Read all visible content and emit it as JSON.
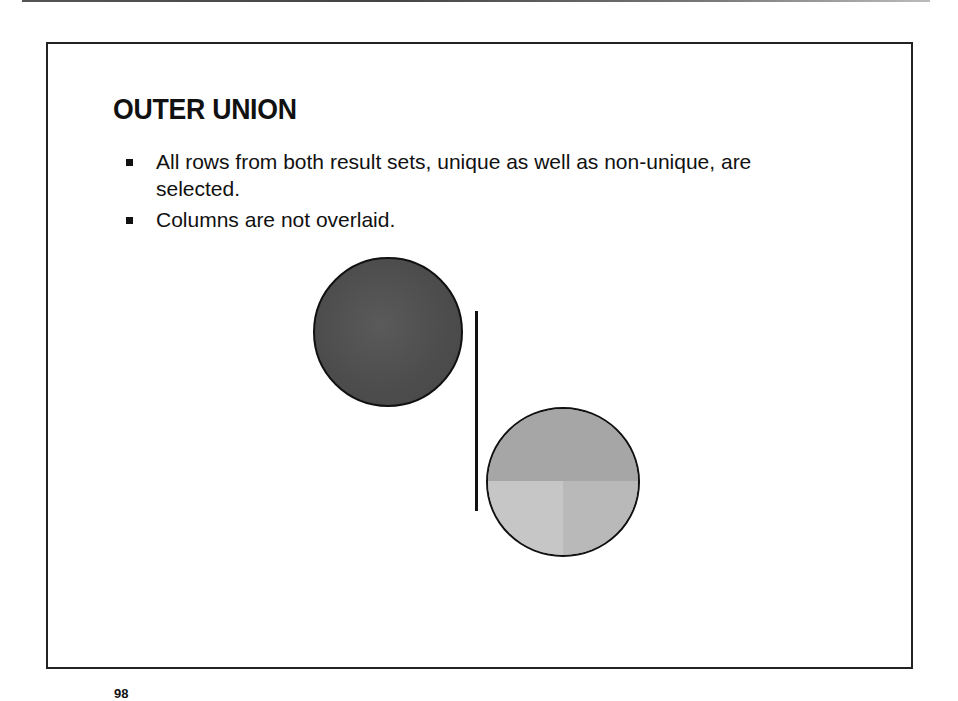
{
  "slide": {
    "title": "OUTER UNION",
    "bullets": [
      {
        "text": "All rows from both result sets, unique as well as non-unique, are selected."
      },
      {
        "text": "Columns are not overlaid."
      }
    ],
    "page_number": "98"
  },
  "diagram": {
    "left_set": {
      "label": "result-set-1",
      "fill": "#4f4f4f"
    },
    "right_set": {
      "label": "result-set-2",
      "fill": "#b0b0b0"
    },
    "separator": {
      "color": "#111111"
    }
  }
}
